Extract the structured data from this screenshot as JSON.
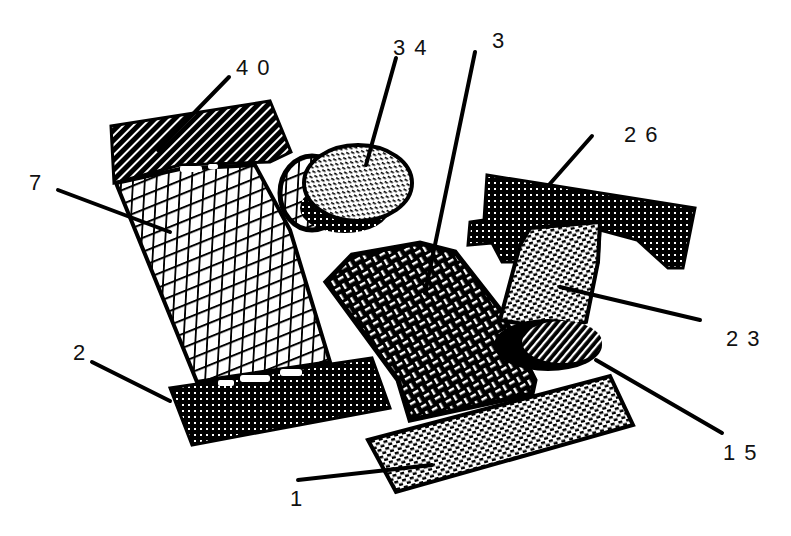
{
  "figure": {
    "background": "#ffffff",
    "ink": "#000000",
    "labels": [
      {
        "id": "40",
        "text": "40",
        "x": 236,
        "y": 57
      },
      {
        "id": "34",
        "text": "34",
        "x": 393,
        "y": 37
      },
      {
        "id": "3",
        "text": "3",
        "x": 492,
        "y": 30
      },
      {
        "id": "7",
        "text": "7",
        "x": 29,
        "y": 172
      },
      {
        "id": "26",
        "text": "26",
        "x": 624,
        "y": 124
      },
      {
        "id": "23",
        "text": "23",
        "x": 726,
        "y": 328
      },
      {
        "id": "2",
        "text": "2",
        "x": 73,
        "y": 342
      },
      {
        "id": "15",
        "text": "15",
        "x": 723,
        "y": 442
      },
      {
        "id": "1",
        "text": "1",
        "x": 290,
        "y": 488
      }
    ],
    "parts": [
      {
        "ref": "40",
        "description": "upper diagonal-hatched block",
        "fill": "diagonal-hatch"
      },
      {
        "ref": "34",
        "description": "oval disk with dashed stipple",
        "fill": "dash-stipple"
      },
      {
        "ref": "3",
        "description": "basket-weave quadrilateral panel",
        "fill": "basket-weave"
      },
      {
        "ref": "7",
        "description": "cross-hatched tilted panel",
        "fill": "crosshatch"
      },
      {
        "ref": "26",
        "description": "dark dotted T-shaped top block",
        "fill": "dark-dots"
      },
      {
        "ref": "23",
        "description": "brick-stipple column",
        "fill": "brick-stipple"
      },
      {
        "ref": "2",
        "description": "dark dotted lower block",
        "fill": "dark-dots"
      },
      {
        "ref": "15",
        "description": "small diagonal-hatched oval",
        "fill": "diagonal-hatch"
      },
      {
        "ref": "1",
        "description": "long brick-stipple base bar",
        "fill": "brick-stipple"
      }
    ]
  }
}
